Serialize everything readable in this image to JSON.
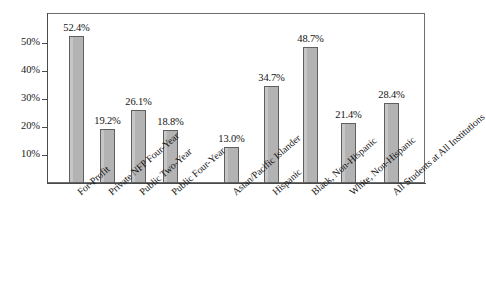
{
  "chart_data": {
    "type": "bar",
    "title": "",
    "subtitle": "",
    "xlabel": "",
    "ylabel": "",
    "ylim": [
      0,
      60.7
    ],
    "grid": false,
    "legend": "none",
    "orientation": "vertical",
    "bar_color": "#b3b3b3",
    "bar_border_color": "#5f5f5f",
    "y_ticks": [
      "10%",
      "20%",
      "30%",
      "40%",
      "50%"
    ],
    "y_tick_values": [
      10,
      20,
      30,
      40,
      50
    ],
    "categories": [
      "For-Profit",
      "Private NFP Four-Year",
      "Public Two-Year",
      "Public Four-Year",
      "Asian/Pacific Islander",
      "Hispanic",
      "Black, Non-Hispanic",
      "White, Non-Hispanic",
      "All Students at All Institutions"
    ],
    "values": [
      52.4,
      19.2,
      26.1,
      18.8,
      13.0,
      34.7,
      48.7,
      21.4,
      28.4
    ],
    "data_labels": [
      "52.4%",
      "19.2%",
      "26.1%",
      "18.8%",
      "13.0%",
      "34.7%",
      "48.7%",
      "21.4%",
      "28.4%"
    ],
    "groups": [
      {
        "name": "Institution Type",
        "indices": [
          0,
          1,
          2,
          3
        ]
      },
      {
        "name": "Race/Ethnicity",
        "indices": [
          4,
          5,
          6,
          7
        ]
      },
      {
        "name": "Overall",
        "indices": [
          8
        ]
      }
    ]
  },
  "layout": {
    "bar_x": [
      69,
      100,
      131,
      163,
      224,
      264,
      303,
      341,
      384
    ],
    "bar_width": 15
  }
}
